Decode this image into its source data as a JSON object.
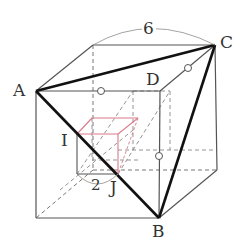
{
  "diagram": {
    "title": "",
    "colors": {
      "edge": "#555555",
      "bold_edge": "#111111",
      "hidden_edge": "#777777",
      "small_cube": "#d97a8a",
      "arc": "#999999"
    },
    "labels": {
      "A": "A",
      "B": "B",
      "C": "C",
      "D": "D",
      "I": "I",
      "J": "J",
      "large_side": "6",
      "small_side": "2"
    },
    "points": {
      "A": [
        36,
        91
      ],
      "B": [
        159,
        218
      ],
      "C": [
        215,
        45
      ],
      "D": [
        160,
        91
      ],
      "I": [
        77,
        134
      ],
      "J": [
        118,
        174
      ]
    },
    "markers": {
      "equal_length_marks": [
        "○ on edge A-D top",
        "○ on segment D-C",
        "○ on vertical edge above B"
      ]
    }
  }
}
